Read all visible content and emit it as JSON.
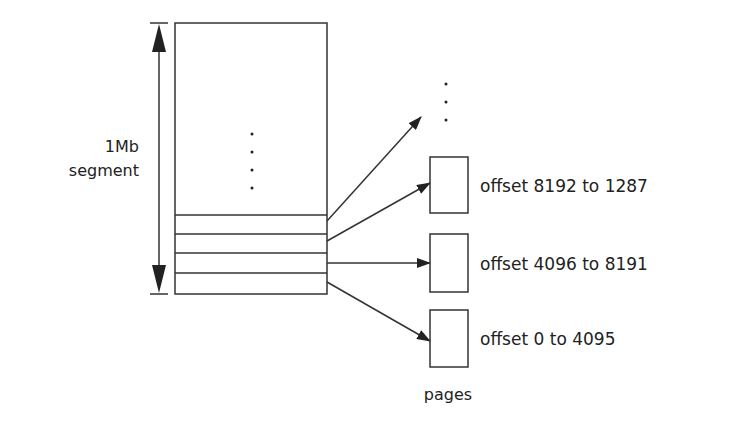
{
  "diagram": {
    "segment_label_line1": "1Mb",
    "segment_label_line2": "segment",
    "pages_label": "pages",
    "pages": [
      {
        "label": "offset 8192 to 1287"
      },
      {
        "label": "offset 4096 to 8191"
      },
      {
        "label": "offset 0 to 4095"
      }
    ],
    "ellipsis_segment": "⋮",
    "ellipsis_pages": "⋮",
    "colors": {
      "stroke": "#333333",
      "text": "#222222",
      "background": "#ffffff"
    }
  }
}
